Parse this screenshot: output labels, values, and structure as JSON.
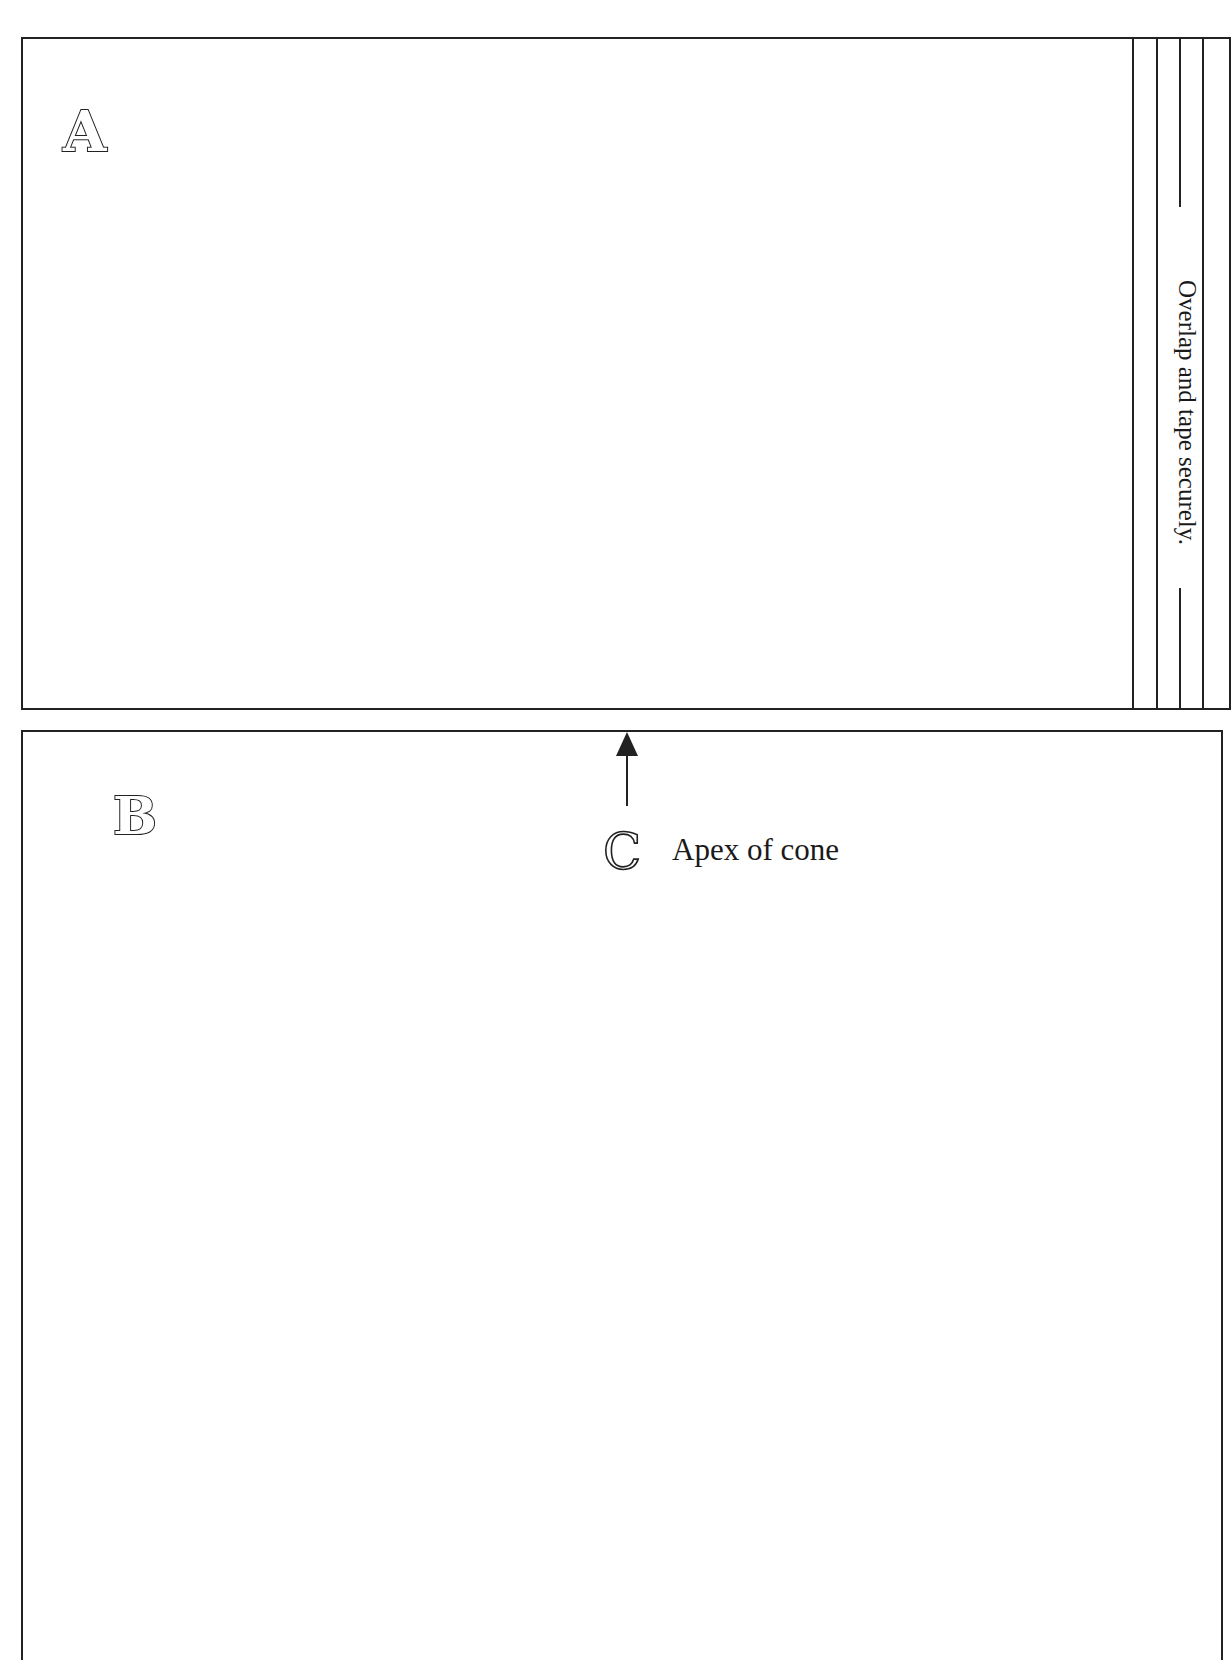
{
  "sheet": {
    "title_visible": false,
    "panels": [
      {
        "id": "A",
        "label": "A",
        "region": "top"
      },
      {
        "id": "B",
        "label": "B",
        "region": "bottom"
      }
    ],
    "marker_c": {
      "label": "C",
      "caption": "Apex of cone",
      "arrow_direction": "up"
    },
    "overlap_strip": {
      "instruction": "Overlap and tape securely.",
      "orientation": "vertical"
    },
    "colors": {
      "line": "#222222",
      "background": "#ffffff",
      "text": "#1a1a1a"
    }
  }
}
